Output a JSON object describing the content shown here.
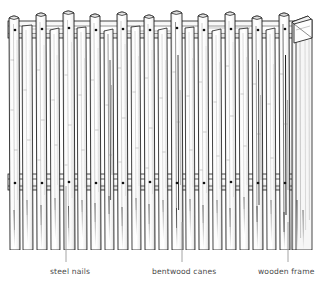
{
  "figure": {
    "style": "black and white technical line drawing",
    "background_color": "#ffffff",
    "ink_color": "#1a1a1a",
    "label_color": "#4a4a4a",
    "leader_color": "#9a9a9a"
  },
  "labels": [
    {
      "id": "steel-nails",
      "text": "steel nails",
      "leader_x": 66,
      "leader_top": 186,
      "leader_bottom": 262,
      "points_to": "nail head on middle rail"
    },
    {
      "id": "bentwood-canes",
      "text": "bentwood canes",
      "leader_x": 182,
      "leader_top": 222,
      "leader_bottom": 262,
      "points_to": "vertical cane"
    },
    {
      "id": "wooden-frame",
      "text": "wooden frame",
      "leader_x": 288,
      "leader_top": 222,
      "leader_bottom": 262,
      "points_to": "right-hand frame post"
    }
  ],
  "structure": {
    "cane_count": 22,
    "cane_color_light": "#fbfbfb",
    "cane_color_edge": "#2a2a2a",
    "rails": [
      {
        "id": "top-rail",
        "y": 20,
        "height": 18,
        "nail_count": 10
      },
      {
        "id": "middle-rail",
        "y": 174,
        "height": 16,
        "nail_count": 10
      }
    ],
    "nail_dot_color": "#111111",
    "frame_post_right": {
      "x": 292,
      "width": 18
    }
  }
}
